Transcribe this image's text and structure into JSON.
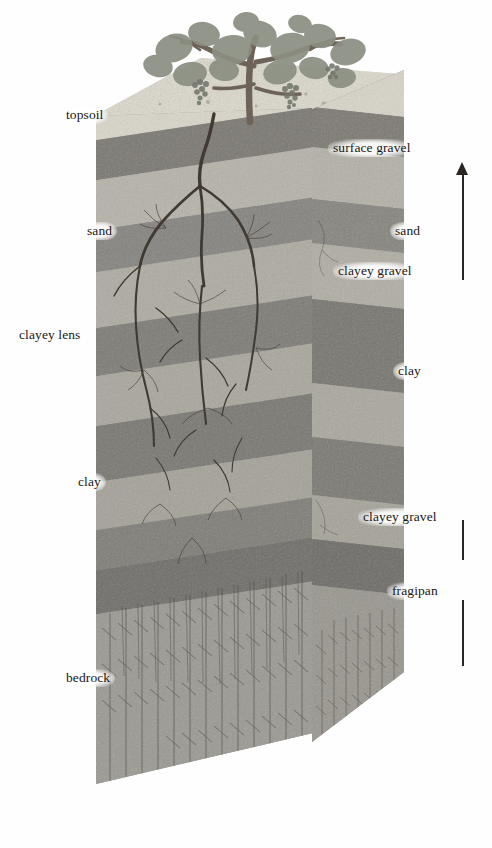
{
  "plant": {
    "name": "grapevine",
    "parts": [
      "leaves",
      "grape-clusters",
      "trunk",
      "root-system"
    ]
  },
  "axis": {
    "label": "SOIL THICKNESS",
    "direction": "up",
    "arrowhead": "top"
  },
  "labels_left": [
    {
      "text": "topsoil",
      "x": 61,
      "y": 106
    },
    {
      "text": "sand",
      "x": 82,
      "y": 222
    },
    {
      "text": "clayey lens",
      "x": 14,
      "y": 326
    },
    {
      "text": "clay",
      "x": 73,
      "y": 473
    },
    {
      "text": "bedrock",
      "x": 61,
      "y": 669
    }
  ],
  "labels_right": [
    {
      "text": "surface gravel",
      "x": 328,
      "y": 139
    },
    {
      "text": "sand",
      "x": 390,
      "y": 222
    },
    {
      "text": "clayey gravel",
      "x": 333,
      "y": 262
    },
    {
      "text": "clay",
      "x": 393,
      "y": 362
    },
    {
      "text": "clayey gravel",
      "x": 358,
      "y": 508
    },
    {
      "text": "fragipan",
      "x": 387,
      "y": 582
    }
  ],
  "horizons": [
    {
      "name": "surface gravel",
      "color": "#ded9cf",
      "material": "gravel"
    },
    {
      "name": "topsoil",
      "color": "#7e7b74",
      "material": "organic-soil"
    },
    {
      "name": "sand",
      "color": "#b5b2a9",
      "material": "sand"
    },
    {
      "name": "clayey gravel",
      "color": "#85837d",
      "material": "clayey-gravel"
    },
    {
      "name": "clayey lens",
      "color": "#9d9a92",
      "material": "clay-lens"
    },
    {
      "name": "clay",
      "color": "#7b7974",
      "material": "clay"
    },
    {
      "name": "fragipan",
      "color": "#74726d",
      "material": "fragipan"
    },
    {
      "name": "bedrock",
      "color": "#9b9a94",
      "material": "fractured-rock"
    }
  ],
  "colors": {
    "ink": "#191613",
    "axis": "#2a2622",
    "front_face": "#9a9a96",
    "side_face": "#8d8d88",
    "top_face": "#d9d6cd",
    "background": "#ffffff"
  }
}
